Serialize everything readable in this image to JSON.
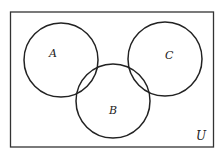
{
  "diagram": {
    "type": "venn",
    "universe_label": "U",
    "sets": [
      {
        "label": "A",
        "cx": 61,
        "cy": 60,
        "r": 37
      },
      {
        "label": "B",
        "cx": 113,
        "cy": 101,
        "r": 37
      },
      {
        "label": "C",
        "cx": 165,
        "cy": 59,
        "r": 37
      }
    ],
    "stroke_color": "#222222",
    "background_color": "#ffffff"
  }
}
